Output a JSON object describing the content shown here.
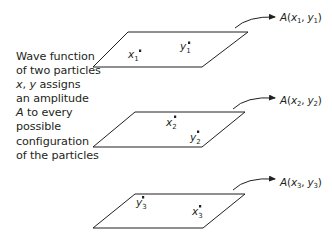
{
  "caption": {
    "lines": [
      "Wave function",
      "of two particles",
      "x, y assigns",
      "an amplitude",
      "A to every",
      "possible",
      "configuration",
      "of the particles"
    ],
    "italic_parts": [
      "x",
      "y",
      "A"
    ]
  },
  "configurations": [
    {
      "id": 1,
      "amplitude_label": "A(x1, y1)",
      "amplitude": {
        "symbol": "A",
        "x_sub": "1",
        "y_sub": "1"
      },
      "points": [
        {
          "name": "x",
          "sub": "1"
        },
        {
          "name": "y",
          "sub": "1"
        }
      ]
    },
    {
      "id": 2,
      "amplitude_label": "A(x2, y2)",
      "amplitude": {
        "symbol": "A",
        "x_sub": "2",
        "y_sub": "2"
      },
      "points": [
        {
          "name": "x",
          "sub": "2"
        },
        {
          "name": "y",
          "sub": "2"
        }
      ]
    },
    {
      "id": 3,
      "amplitude_label": "A(x3, y3)",
      "amplitude": {
        "symbol": "A",
        "x_sub": "3",
        "y_sub": "3"
      },
      "points": [
        {
          "name": "y",
          "sub": "3"
        },
        {
          "name": "x",
          "sub": "3"
        }
      ]
    }
  ],
  "colors": {
    "ink": "#231f20",
    "background": "#ffffff"
  }
}
